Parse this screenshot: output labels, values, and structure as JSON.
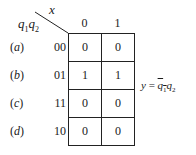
{
  "kmap": {
    "col_variable": "x",
    "row_variable_1": "q",
    "row_variable_1_sub": "1",
    "row_variable_2": "q",
    "row_variable_2_sub": "2",
    "col_headers": [
      "0",
      "1"
    ],
    "rows": [
      {
        "label_open": "(",
        "label_letter": "a",
        "label_close": ")",
        "code": "00",
        "cells": [
          "0",
          "0"
        ]
      },
      {
        "label_open": "(",
        "label_letter": "b",
        "label_close": ")",
        "code": "01",
        "cells": [
          "1",
          "1"
        ]
      },
      {
        "label_open": "(",
        "label_letter": "c",
        "label_close": ")",
        "code": "11",
        "cells": [
          "0",
          "0"
        ]
      },
      {
        "label_open": "(",
        "label_letter": "d",
        "label_close": ")",
        "code": "10",
        "cells": [
          "0",
          "0"
        ]
      }
    ]
  },
  "equation": {
    "lhs": "y",
    "equals": " = ",
    "term1_var": "q",
    "term1_sub": "1",
    "term2_var": "q",
    "term2_sub": "2"
  }
}
